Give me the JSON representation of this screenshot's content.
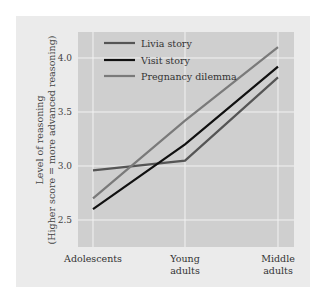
{
  "chart_data": {
    "type": "line",
    "title": "",
    "xlabel": "",
    "ylabel": "Level of reasoning",
    "ylabel_sub": "(Higher score = more advanced reasoning)",
    "categories": [
      "Adolescents",
      "Young adults",
      "Middle adults"
    ],
    "category_lines": [
      [
        "Adolescents"
      ],
      [
        "Young",
        "adults"
      ],
      [
        "Middle",
        "adults"
      ]
    ],
    "y_ticks": [
      "2.5",
      "3.0",
      "3.5",
      "4.0"
    ],
    "ylim": [
      2.25,
      4.25
    ],
    "grid": true,
    "legend_position": "upper-left",
    "series": [
      {
        "name": "Livia story",
        "values": [
          2.96,
          3.05,
          3.82
        ],
        "color": "#555555"
      },
      {
        "name": "Visit story",
        "values": [
          2.6,
          3.2,
          3.92
        ],
        "color": "#111111"
      },
      {
        "name": "Pregnancy dilemma",
        "values": [
          2.7,
          3.42,
          4.1
        ],
        "color": "#7a7a7a"
      }
    ]
  },
  "colors": {
    "panel_bg": "#ebebeb",
    "plot_bg": "#cfcfcf",
    "grid": "#f2f2f2"
  }
}
